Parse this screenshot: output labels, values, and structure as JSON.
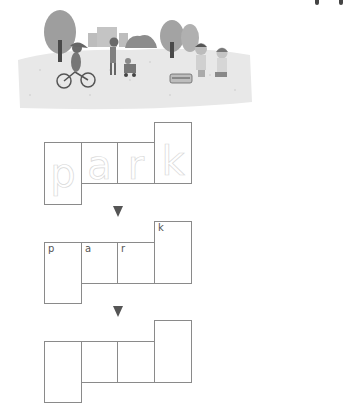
{
  "illustration": {
    "description": "park scene: child on bicycle, adult pushing stroller, trees, buildings, two children having a picnic",
    "colors": {
      "ground": "#e6e6e6",
      "tree": "#9a9a9a",
      "trunk": "#4a4a4a",
      "building": "#bdbdbd"
    }
  },
  "worksheet": {
    "word": "park",
    "rows": [
      {
        "type": "trace",
        "letters": [
          "p",
          "a",
          "r",
          "k"
        ]
      },
      {
        "type": "hint",
        "letters": [
          "p",
          "a",
          "r",
          "k"
        ]
      },
      {
        "type": "blank",
        "letters": [
          "",
          "",
          "",
          ""
        ]
      }
    ],
    "arrow_icon": "down-triangle",
    "colors": {
      "box_border": "#8a8a8a",
      "trace_letter": "#d8d8d8",
      "hint_letter": "#555555",
      "arrow": "#555555"
    }
  }
}
